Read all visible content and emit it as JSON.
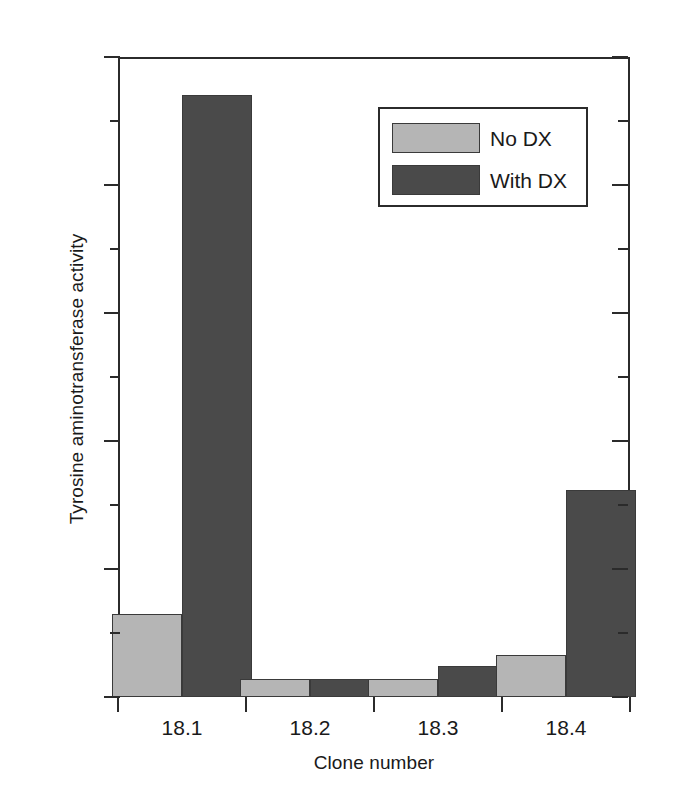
{
  "chart_data": {
    "type": "bar",
    "title": "",
    "xlabel": "Clone number",
    "ylabel": "Tyrosine aminotransferase activity",
    "categories": [
      "18.1",
      "18.2",
      "18.3",
      "18.4"
    ],
    "series": [
      {
        "name": "No DX",
        "values": [
          6.5,
          1.4,
          1.4,
          3.3
        ],
        "color": "#b5b5b5"
      },
      {
        "name": "With DX",
        "values": [
          47.0,
          1.4,
          2.4,
          16.2
        ],
        "color": "#4a4a4a"
      }
    ],
    "ylim": [
      0,
      50
    ],
    "ytick_labels": [
      "0",
      "10",
      "20",
      "30",
      "40",
      "50"
    ],
    "ytick_values": [
      0,
      10,
      20,
      30,
      40,
      50
    ],
    "yminor_values": [
      5,
      15,
      25,
      35,
      45
    ],
    "grid": false,
    "legend_position": "upper right",
    "axis_color": "#2b2b2b"
  },
  "legend": {
    "entries": [
      {
        "label": "No DX"
      },
      {
        "label": "With DX"
      }
    ]
  }
}
